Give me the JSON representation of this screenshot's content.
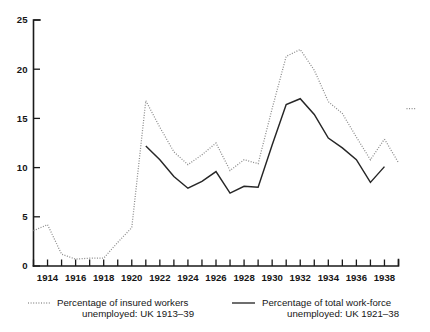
{
  "chart_data": {
    "type": "line",
    "title": "",
    "subtitle": "",
    "xlabel": "",
    "ylabel": "",
    "xlim": [
      1913,
      1939
    ],
    "ylim": [
      0,
      25
    ],
    "yticks": [
      0,
      5,
      10,
      15,
      20,
      25
    ],
    "xticks_all": [
      1913,
      1914,
      1915,
      1916,
      1917,
      1918,
      1919,
      1920,
      1921,
      1922,
      1923,
      1924,
      1925,
      1926,
      1927,
      1928,
      1929,
      1930,
      1931,
      1932,
      1933,
      1934,
      1935,
      1936,
      1937,
      1938,
      1939
    ],
    "xtick_labels": [
      "1914",
      "1916",
      "1918",
      "1920",
      "1922",
      "1924",
      "1926",
      "1928",
      "1930",
      "1932",
      "1934",
      "1936",
      "1938"
    ],
    "xtick_label_years": [
      1914,
      1916,
      1918,
      1920,
      1922,
      1924,
      1926,
      1928,
      1930,
      1932,
      1934,
      1936,
      1938
    ],
    "grid": false,
    "legend_position": "below",
    "series": [
      {
        "name": "Percentage of insured workers unemployed: UK 1913–39",
        "style": "dotted",
        "color": "#8a8a8a",
        "x": [
          1913,
          1914,
          1915,
          1916,
          1917,
          1918,
          1919,
          1920,
          1921,
          1922,
          1923,
          1924,
          1925,
          1926,
          1927,
          1928,
          1929,
          1930,
          1931,
          1932,
          1933,
          1934,
          1935,
          1936,
          1937,
          1938
        ],
        "values": [
          3.6,
          4.2,
          1.2,
          0.7,
          0.8,
          0.8,
          2.4,
          3.9,
          16.8,
          14.1,
          11.6,
          10.3,
          11.3,
          12.5,
          9.7,
          10.8,
          10.4,
          16.0,
          21.3,
          22.0,
          19.9,
          16.7,
          15.5,
          13.1,
          10.8,
          12.9
        ],
        "values_tail": [
          1938,
          1939
        ],
        "tail_segment": [
          12.9,
          10.5
        ],
        "isolated_point": {
          "x": 1939,
          "y": 16.0
        }
      },
      {
        "name": "Percentage of total work-force unemployed: UK 1921–38",
        "style": "solid",
        "color": "#262626",
        "x": [
          1921,
          1922,
          1923,
          1924,
          1925,
          1926,
          1927,
          1928,
          1929,
          1930,
          1931,
          1932,
          1933,
          1934,
          1935,
          1936,
          1937,
          1938
        ],
        "values": [
          12.2,
          10.8,
          9.1,
          7.9,
          8.6,
          9.6,
          7.4,
          8.1,
          8.0,
          12.3,
          16.4,
          17.0,
          15.4,
          13.0,
          12.0,
          10.8,
          8.5,
          10.1
        ]
      }
    ]
  },
  "axes": {
    "y_tick_labels": [
      "0",
      "5",
      "10",
      "15",
      "20",
      "25"
    ],
    "x_tick_labels": [
      "1914",
      "1916",
      "1918",
      "1920",
      "1922",
      "1924",
      "1926",
      "1928",
      "1930",
      "1932",
      "1934",
      "1936",
      "1938"
    ]
  },
  "legend": {
    "entries": [
      {
        "swatch": "dotted-line-swatch",
        "line1": "Percentage of insured workers",
        "line2": "unemployed: UK 1913–39"
      },
      {
        "swatch": "solid-line-swatch",
        "line1": "Percentage of total work-force",
        "line2": "unemployed: UK 1921–38"
      }
    ]
  }
}
